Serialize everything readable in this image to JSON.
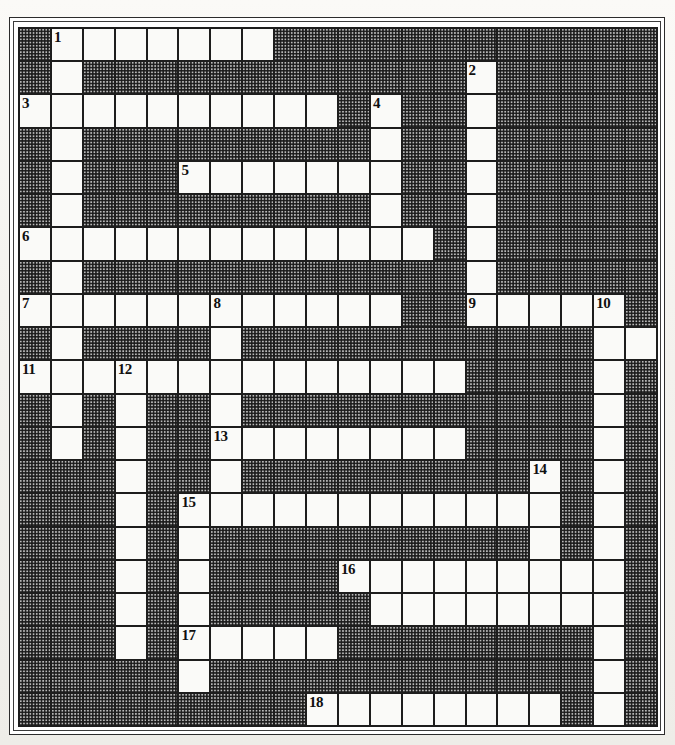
{
  "puzzle": {
    "kind": "crossword-grid",
    "columns": 20,
    "rows": 21,
    "cell_size_px": 32,
    "colors": {
      "block_fill": "#b9b9b9",
      "block_stipple": "#191919",
      "open_cell": "#fafaf8",
      "grid_line": "#1d1d1d",
      "number_text": "#101010",
      "paper": "#f2f1ee"
    },
    "legend": {
      "open_cell_meaning": "letter square (white / empty, fillable)",
      "block_cell_meaning": "blocked square (shaded stipple, not fillable)"
    },
    "clue_numbers": [
      {
        "number": "1",
        "row": 0,
        "col": 1
      },
      {
        "number": "2",
        "row": 1,
        "col": 14
      },
      {
        "number": "3",
        "row": 2,
        "col": 0
      },
      {
        "number": "4",
        "row": 2,
        "col": 11
      },
      {
        "number": "5",
        "row": 4,
        "col": 5
      },
      {
        "number": "6",
        "row": 6,
        "col": 0
      },
      {
        "number": "7",
        "row": 8,
        "col": 0
      },
      {
        "number": "8",
        "row": 8,
        "col": 6
      },
      {
        "number": "9",
        "row": 8,
        "col": 14
      },
      {
        "number": "10",
        "row": 8,
        "col": 18
      },
      {
        "number": "11",
        "row": 10,
        "col": 0
      },
      {
        "number": "12",
        "row": 10,
        "col": 3
      },
      {
        "number": "13",
        "row": 12,
        "col": 6
      },
      {
        "number": "14",
        "row": 13,
        "col": 16
      },
      {
        "number": "15",
        "row": 14,
        "col": 5
      },
      {
        "number": "16",
        "row": 16,
        "col": 10
      },
      {
        "number": "17",
        "row": 18,
        "col": 5
      },
      {
        "number": "18",
        "row": 20,
        "col": 9
      }
    ],
    "grid": [
      "BWWWWWWWBBBBBBBBBBBB",
      "BWBBBBBBBBBBBBWBBBBB",
      "WWWWWWWWWWBWBBWBBBBB",
      "BWBBBBBBBBBWBBWBBBBB",
      "BWBBBWWWWWWWBBWBBBBB",
      "BWBBBBBBBBBWBBWBBBBB",
      "WWWWWWWWWWWWWBWBBBBB",
      "BWBBBBBBBBBBBBWBBBBB",
      "WWWWWWWWWWWWBBWWWWWB",
      "BWBBBBWBBBBBBBBBBBWW",
      "WWWWWWWWWWWWWWBBBBWB",
      "BWBWBBWBBBBBBBBBBBWB",
      "BWBWBBWWWWWWWWBBBBWB",
      "BBBWBBWBBBBBBBBBWBWB",
      "BBBWBWWWWWWWWWWWWBWB",
      "BBBWBWBBBBBBBBBBWBWB",
      "BBBWBWBBBBWWWWWWWWWB",
      "BBBWBWBBBBBWWWWWWWWB",
      "BBBWBWWWWWBBBBBBBBWB",
      "BBBBBWBBBBBBBBBBBBWB",
      "BBBBBBBBBWWWWWWWWBWB"
    ]
  }
}
